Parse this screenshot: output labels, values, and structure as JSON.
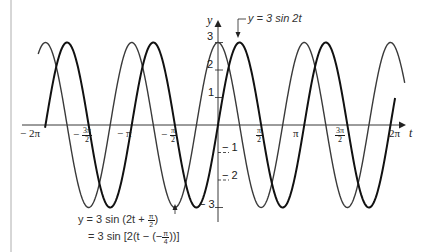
{
  "chart_data": {
    "type": "line",
    "title": "",
    "xlabel": "t",
    "ylabel": "y",
    "xlim": [
      -6.6,
      7.0
    ],
    "ylim": [
      -3.3,
      3.3
    ],
    "grid": false,
    "legend": "annotations",
    "x_ticks": [
      {
        "value": -6.2832,
        "label": "-2π"
      },
      {
        "value": -4.7124,
        "label": "-3π/2"
      },
      {
        "value": -3.1416,
        "label": "-π"
      },
      {
        "value": -1.5708,
        "label": "-π/2"
      },
      {
        "value": 1.5708,
        "label": "π/2"
      },
      {
        "value": 3.1416,
        "label": "π"
      },
      {
        "value": 4.7124,
        "label": "3π/2"
      },
      {
        "value": 6.2832,
        "label": "2π"
      }
    ],
    "y_ticks": [
      {
        "value": 3,
        "label": "3"
      },
      {
        "value": 2,
        "label": "2"
      },
      {
        "value": 1,
        "label": "1"
      },
      {
        "value": -1,
        "label": "-1"
      },
      {
        "value": -2,
        "label": "-2"
      },
      {
        "value": -3,
        "label": "-3"
      }
    ],
    "series": [
      {
        "name": "y = 3 sin 2t",
        "formula": "3*sin(2t)",
        "amplitude": 3,
        "angular_frequency": 2,
        "phase": 0,
        "t_range": [
          -6.3,
          6.45
        ],
        "color": "#111111",
        "stroke_width": 2.0
      },
      {
        "name": "y = 3 sin (2t + π/2) = 3 sin[2(t − (−π/4))]",
        "formula": "3*sin(2t + pi/2)",
        "amplitude": 3,
        "angular_frequency": 2,
        "phase": 1.5708,
        "t_range": [
          -6.55,
          6.8
        ],
        "color": "#3a3a3a",
        "stroke_width": 1.4
      }
    ],
    "annotations": [
      {
        "text": "y = 3 sin 2t",
        "points_to": "peak of y = 3 sin 2t at t = π/4"
      },
      {
        "text": "y = 3 sin (2t + π/2) = 3 sin[2(t − (−π/4))]",
        "points_to": "trough of shifted curve near t = −π/2"
      }
    ]
  },
  "labels": {
    "y_axis": "y",
    "t_axis": "t",
    "ann_top": "y = 3 sin 2t",
    "ann_bottom_line1_pre": "y = 3 sin (2t + ",
    "ann_bottom_line1_post": ")",
    "ann_bottom_line2_pre": "= 3 sin [2(t − (−",
    "ann_bottom_line2_post": "))]",
    "pi": "π",
    "two": "2",
    "four": "4",
    "ticks_x": {
      "neg2pi": "− 2π",
      "neg3pi2_num": "3π",
      "neg3pi2_den": "2",
      "neg3pi2_sign": "−",
      "negpi": "− π",
      "negpi2_num": "π",
      "negpi2_den": "2",
      "negpi2_sign": "−",
      "pi2_num": "π",
      "pi2_den": "2",
      "pi": "π",
      "threepi2_num": "3π",
      "threepi2_den": "2",
      "twopi": "2π"
    },
    "ticks_y": {
      "p3": "3",
      "p2": "2",
      "p1": "1",
      "m1": "− 1",
      "m2": "− 2",
      "m3": "− 3"
    }
  }
}
